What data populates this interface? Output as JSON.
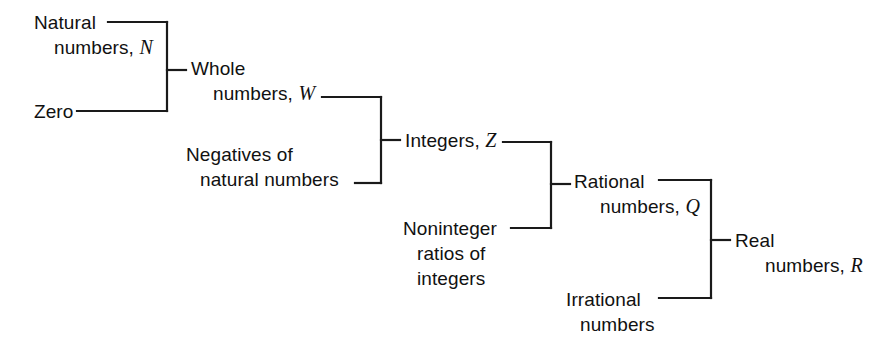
{
  "diagram": {
    "type": "bracket-tree",
    "stroke_color": "#1a1a1a",
    "background_color": "#ffffff",
    "nodes": {
      "natural": {
        "line1": "Natural",
        "line2": "numbers,",
        "symbol": "N"
      },
      "zero": {
        "line1": "Zero"
      },
      "whole": {
        "line1": "Whole",
        "line2": "numbers,",
        "symbol": "W"
      },
      "negatives": {
        "line1": "Negatives of",
        "line2": "natural numbers"
      },
      "integers": {
        "line1": "Integers,",
        "symbol": "Z"
      },
      "noninteger": {
        "line1": "Noninteger",
        "line2": "ratios of",
        "line3": "integers"
      },
      "rational": {
        "line1": "Rational",
        "line2": "numbers,",
        "symbol": "Q"
      },
      "irrational": {
        "line1": "Irrational",
        "line2": "numbers"
      },
      "real": {
        "line1": "Real",
        "line2": "numbers,",
        "symbol": "R"
      }
    },
    "groups": [
      {
        "name": "whole-numbers-group",
        "inputs": [
          "natural",
          "zero"
        ],
        "output": "whole"
      },
      {
        "name": "integers-group",
        "inputs": [
          "whole",
          "negatives"
        ],
        "output": "integers"
      },
      {
        "name": "rational-numbers-group",
        "inputs": [
          "integers",
          "noninteger"
        ],
        "output": "rational"
      },
      {
        "name": "real-numbers-group",
        "inputs": [
          "rational",
          "irrational"
        ],
        "output": "real"
      }
    ]
  }
}
